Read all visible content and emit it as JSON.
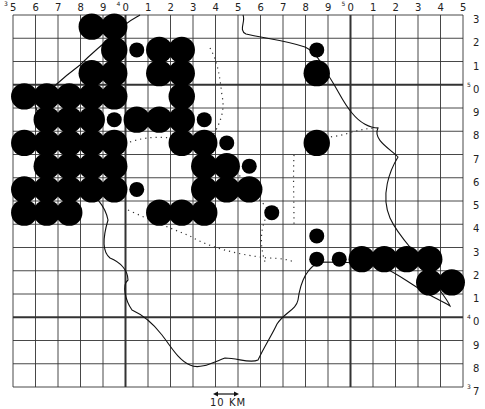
{
  "map": {
    "grid": {
      "cols": 20,
      "rows": 16,
      "left": 13,
      "top": 15,
      "right": 463,
      "bottom": 387,
      "major_col_indices": [
        5,
        15
      ],
      "major_row_indices": [
        3,
        13
      ]
    },
    "top_labels": [
      {
        "text": "5",
        "sup": "3"
      },
      {
        "text": "6"
      },
      {
        "text": "7"
      },
      {
        "text": "8"
      },
      {
        "text": "9"
      },
      {
        "text": "0",
        "sup": "4"
      },
      {
        "text": "1"
      },
      {
        "text": "2"
      },
      {
        "text": "3"
      },
      {
        "text": "4"
      },
      {
        "text": "5"
      },
      {
        "text": "6"
      },
      {
        "text": "7"
      },
      {
        "text": "8"
      },
      {
        "text": "9"
      },
      {
        "text": "0",
        "sup": "5"
      },
      {
        "text": "1"
      },
      {
        "text": "2"
      },
      {
        "text": "3"
      },
      {
        "text": "4"
      },
      {
        "text": "5"
      }
    ],
    "right_labels": [
      {
        "text": "3"
      },
      {
        "text": "2"
      },
      {
        "text": "1"
      },
      {
        "text": "0",
        "sup": "5"
      },
      {
        "text": "9"
      },
      {
        "text": "8"
      },
      {
        "text": "7"
      },
      {
        "text": "6"
      },
      {
        "text": "5"
      },
      {
        "text": "4"
      },
      {
        "text": "3"
      },
      {
        "text": "2"
      },
      {
        "text": "1"
      },
      {
        "text": "0",
        "sup": "4"
      },
      {
        "text": "9"
      },
      {
        "text": "8"
      },
      {
        "text": "7",
        "sup": "3"
      }
    ],
    "scale_bar": {
      "label": "10 KM"
    },
    "dots": [
      {
        "c": 3,
        "r": 0,
        "s": "L"
      },
      {
        "c": 4,
        "r": 0,
        "s": "L"
      },
      {
        "c": 4,
        "r": 1,
        "s": "L"
      },
      {
        "c": 5,
        "r": 1,
        "s": "S"
      },
      {
        "c": 6,
        "r": 1,
        "s": "L"
      },
      {
        "c": 7,
        "r": 1,
        "s": "L"
      },
      {
        "c": 13,
        "r": 1,
        "s": "S"
      },
      {
        "c": 3,
        "r": 2,
        "s": "L"
      },
      {
        "c": 4,
        "r": 2,
        "s": "L"
      },
      {
        "c": 6,
        "r": 2,
        "s": "L"
      },
      {
        "c": 7,
        "r": 2,
        "s": "L"
      },
      {
        "c": 13,
        "r": 2,
        "s": "L"
      },
      {
        "c": 0,
        "r": 3,
        "s": "L"
      },
      {
        "c": 1,
        "r": 3,
        "s": "L"
      },
      {
        "c": 2,
        "r": 3,
        "s": "L"
      },
      {
        "c": 3,
        "r": 3,
        "s": "L"
      },
      {
        "c": 4,
        "r": 3,
        "s": "L"
      },
      {
        "c": 7,
        "r": 3,
        "s": "L"
      },
      {
        "c": 1,
        "r": 4,
        "s": "L"
      },
      {
        "c": 2,
        "r": 4,
        "s": "L"
      },
      {
        "c": 3,
        "r": 4,
        "s": "L"
      },
      {
        "c": 4,
        "r": 4,
        "s": "S"
      },
      {
        "c": 5,
        "r": 4,
        "s": "L"
      },
      {
        "c": 6,
        "r": 4,
        "s": "L"
      },
      {
        "c": 7,
        "r": 4,
        "s": "L"
      },
      {
        "c": 8,
        "r": 4,
        "s": "S"
      },
      {
        "c": 0,
        "r": 5,
        "s": "L"
      },
      {
        "c": 1,
        "r": 5,
        "s": "L"
      },
      {
        "c": 2,
        "r": 5,
        "s": "L"
      },
      {
        "c": 3,
        "r": 5,
        "s": "L"
      },
      {
        "c": 4,
        "r": 5,
        "s": "L"
      },
      {
        "c": 7,
        "r": 5,
        "s": "L"
      },
      {
        "c": 8,
        "r": 5,
        "s": "L"
      },
      {
        "c": 9,
        "r": 5,
        "s": "S"
      },
      {
        "c": 13,
        "r": 5,
        "s": "L"
      },
      {
        "c": 1,
        "r": 6,
        "s": "L"
      },
      {
        "c": 2,
        "r": 6,
        "s": "L"
      },
      {
        "c": 3,
        "r": 6,
        "s": "L"
      },
      {
        "c": 4,
        "r": 6,
        "s": "L"
      },
      {
        "c": 8,
        "r": 6,
        "s": "L"
      },
      {
        "c": 9,
        "r": 6,
        "s": "L"
      },
      {
        "c": 10,
        "r": 6,
        "s": "S"
      },
      {
        "c": 0,
        "r": 7,
        "s": "L"
      },
      {
        "c": 1,
        "r": 7,
        "s": "L"
      },
      {
        "c": 2,
        "r": 7,
        "s": "L"
      },
      {
        "c": 3,
        "r": 7,
        "s": "L"
      },
      {
        "c": 4,
        "r": 7,
        "s": "L"
      },
      {
        "c": 5,
        "r": 7,
        "s": "S"
      },
      {
        "c": 8,
        "r": 7,
        "s": "L"
      },
      {
        "c": 9,
        "r": 7,
        "s": "L"
      },
      {
        "c": 10,
        "r": 7,
        "s": "L"
      },
      {
        "c": 0,
        "r": 8,
        "s": "L"
      },
      {
        "c": 1,
        "r": 8,
        "s": "L"
      },
      {
        "c": 2,
        "r": 8,
        "s": "L"
      },
      {
        "c": 6,
        "r": 8,
        "s": "L"
      },
      {
        "c": 7,
        "r": 8,
        "s": "L"
      },
      {
        "c": 8,
        "r": 8,
        "s": "L"
      },
      {
        "c": 11,
        "r": 8,
        "s": "S"
      },
      {
        "c": 13,
        "r": 9,
        "s": "S"
      },
      {
        "c": 13,
        "r": 10,
        "s": "S"
      },
      {
        "c": 14,
        "r": 10,
        "s": "S"
      },
      {
        "c": 15,
        "r": 10,
        "s": "L"
      },
      {
        "c": 16,
        "r": 10,
        "s": "L"
      },
      {
        "c": 17,
        "r": 10,
        "s": "L"
      },
      {
        "c": 18,
        "r": 10,
        "s": "L"
      },
      {
        "c": 18,
        "r": 11,
        "s": "L"
      },
      {
        "c": 19,
        "r": 11,
        "s": "L"
      }
    ],
    "colors": {
      "ink": "#000000",
      "grid": "#333333",
      "background": "#ffffff"
    }
  }
}
